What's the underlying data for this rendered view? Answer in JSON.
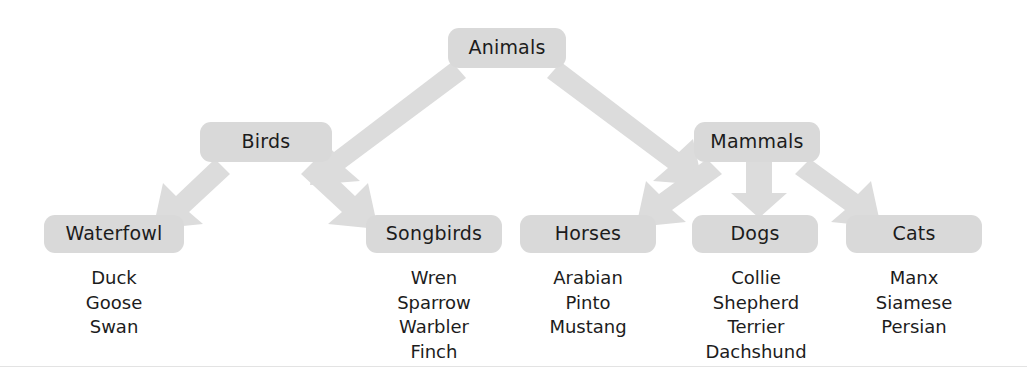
{
  "diagram": {
    "type": "hierarchy-tree",
    "title": "Animals",
    "box_color": "#d9d9d9",
    "arrow_color": "#dcdcdc",
    "text_color": "#1c1c1c",
    "background": "#ffffff",
    "root": {
      "label": "Animals"
    },
    "level2": [
      {
        "label": "Birds"
      },
      {
        "label": "Mammals"
      }
    ],
    "level3": [
      {
        "label": "Waterfowl",
        "parent": "Birds",
        "items": [
          "Duck",
          "Goose",
          "Swan"
        ]
      },
      {
        "label": "Songbirds",
        "parent": "Birds",
        "items": [
          "Wren",
          "Sparrow",
          "Warbler",
          "Finch"
        ]
      },
      {
        "label": "Horses",
        "parent": "Mammals",
        "items": [
          "Arabian",
          "Pinto",
          "Mustang"
        ]
      },
      {
        "label": "Dogs",
        "parent": "Mammals",
        "items": [
          "Collie",
          "Shepherd",
          "Terrier",
          "Dachshund"
        ]
      },
      {
        "label": "Cats",
        "parent": "Mammals",
        "items": [
          "Manx",
          "Siamese",
          "Persian"
        ]
      }
    ],
    "connections": [
      {
        "from": "Animals",
        "to": "Birds"
      },
      {
        "from": "Animals",
        "to": "Mammals"
      },
      {
        "from": "Birds",
        "to": "Waterfowl"
      },
      {
        "from": "Birds",
        "to": "Songbirds"
      },
      {
        "from": "Mammals",
        "to": "Horses"
      },
      {
        "from": "Mammals",
        "to": "Dogs"
      },
      {
        "from": "Mammals",
        "to": "Cats"
      }
    ]
  }
}
